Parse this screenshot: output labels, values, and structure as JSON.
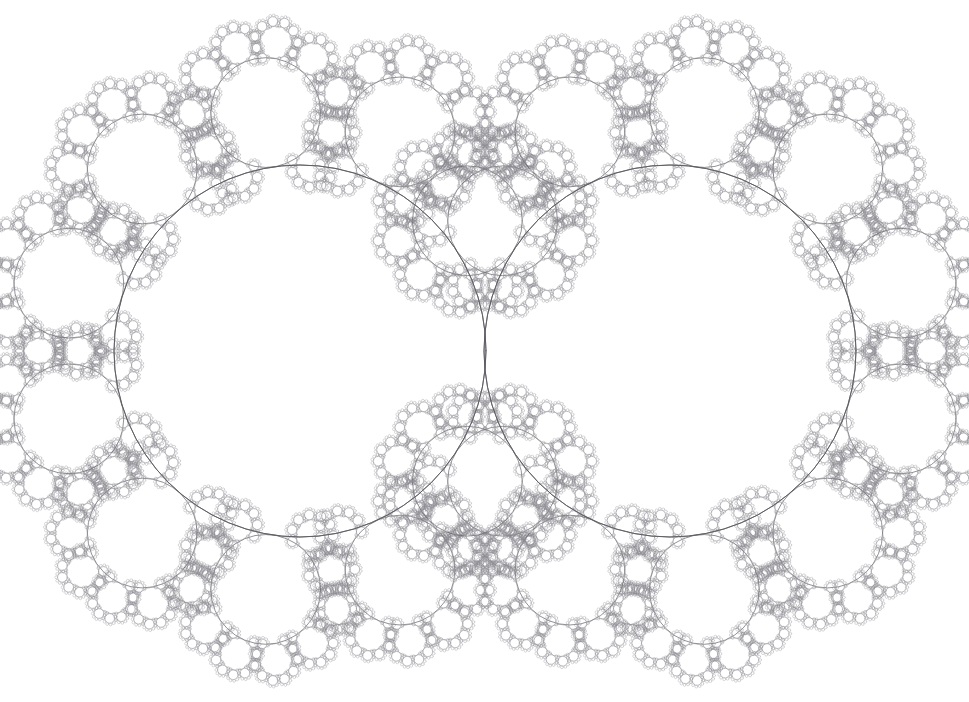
{
  "page": {
    "width": 969,
    "height": 702,
    "background_color": "#ffffff"
  },
  "clipped_header": {
    "visible": true,
    "left_text": "",
    "right_text": "",
    "note": "faint partially-cropped running head at top edge"
  },
  "figure": {
    "name": "kleinian-limit-set",
    "type": "fractal-circle-packing",
    "stroke_color": "#5a5a60",
    "stroke_color_light": "#8a8a90",
    "fill_color": "none",
    "background_color": "#ffffff",
    "base_stroke_width": 0.85,
    "symmetry": "mirror about vertical axis x=485 and horizontal axis y=351",
    "tangency_point": {
      "x": 485,
      "y": 351
    }
  },
  "chart_data": {
    "type": "scatter",
    "xlabel": "",
    "ylabel": "",
    "xlim": [
      0,
      969
    ],
    "ylim": [
      0,
      702
    ],
    "grid": false,
    "legend": "none",
    "recursion_depth": 4,
    "satellites_per_ring": 11,
    "child_radius_ratio": 0.295,
    "generation_radius_ratio": 0.3,
    "primary_circles": [
      {
        "name": "main-left",
        "cx": 300,
        "cy": 351,
        "r": 186
      },
      {
        "name": "main-right",
        "cx": 670,
        "cy": 351,
        "r": 186
      }
    ],
    "notable_satellites": [
      {
        "name": "top-left-large",
        "cx": 171,
        "cy": 121,
        "r": 56
      },
      {
        "name": "top-right-large",
        "cx": 799,
        "cy": 121,
        "r": 56
      },
      {
        "name": "bottom-left-large",
        "cx": 171,
        "cy": 581,
        "r": 56
      },
      {
        "name": "bottom-right-large",
        "cx": 799,
        "cy": 581,
        "r": 56
      },
      {
        "name": "left-edge",
        "cx": 69,
        "cy": 348,
        "r": 42
      },
      {
        "name": "right-edge",
        "cx": 901,
        "cy": 348,
        "r": 42
      },
      {
        "name": "top-inner-left",
        "cx": 330,
        "cy": 156,
        "r": 22
      },
      {
        "name": "top-inner-right",
        "cx": 640,
        "cy": 156,
        "r": 22
      }
    ]
  }
}
